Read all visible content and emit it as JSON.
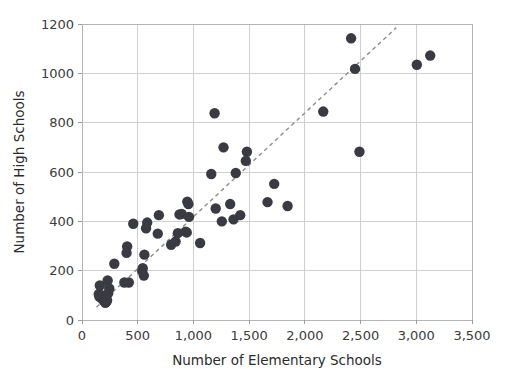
{
  "chart_data": {
    "type": "scatter",
    "title": "",
    "xlabel": "Number of Elementary Schools",
    "ylabel": "Number of High Schools",
    "xlim": [
      0,
      3500
    ],
    "ylim": [
      0,
      1200
    ],
    "grid": true,
    "legend": null,
    "xticks": [
      0,
      500,
      1000,
      1500,
      2000,
      2500,
      3000,
      3500
    ],
    "xticklabels": [
      "0",
      "500",
      "1,000",
      "1,500",
      "2,000",
      "2,500",
      "3,000",
      "3,500"
    ],
    "yticks": [
      0,
      200,
      400,
      600,
      800,
      1000,
      1200
    ],
    "yticklabels": [
      "0",
      "200",
      "400",
      "600",
      "800",
      "1000",
      "1200"
    ],
    "marker_color": "#3a3a42",
    "marker_size": 5.2,
    "grid_color": "#cfcfcf",
    "points": [
      {
        "x": 150,
        "y": 105
      },
      {
        "x": 155,
        "y": 95
      },
      {
        "x": 160,
        "y": 140
      },
      {
        "x": 175,
        "y": 88
      },
      {
        "x": 185,
        "y": 100
      },
      {
        "x": 195,
        "y": 78
      },
      {
        "x": 200,
        "y": 82
      },
      {
        "x": 205,
        "y": 90
      },
      {
        "x": 210,
        "y": 70
      },
      {
        "x": 215,
        "y": 85
      },
      {
        "x": 220,
        "y": 75
      },
      {
        "x": 225,
        "y": 80
      },
      {
        "x": 230,
        "y": 160
      },
      {
        "x": 235,
        "y": 108
      },
      {
        "x": 245,
        "y": 128
      },
      {
        "x": 290,
        "y": 228
      },
      {
        "x": 380,
        "y": 152
      },
      {
        "x": 400,
        "y": 272
      },
      {
        "x": 405,
        "y": 298
      },
      {
        "x": 420,
        "y": 152
      },
      {
        "x": 460,
        "y": 390
      },
      {
        "x": 540,
        "y": 198
      },
      {
        "x": 545,
        "y": 210
      },
      {
        "x": 555,
        "y": 180
      },
      {
        "x": 560,
        "y": 265
      },
      {
        "x": 575,
        "y": 372
      },
      {
        "x": 585,
        "y": 395
      },
      {
        "x": 680,
        "y": 350
      },
      {
        "x": 690,
        "y": 425
      },
      {
        "x": 800,
        "y": 305
      },
      {
        "x": 840,
        "y": 318
      },
      {
        "x": 860,
        "y": 352
      },
      {
        "x": 875,
        "y": 428
      },
      {
        "x": 895,
        "y": 430
      },
      {
        "x": 930,
        "y": 358
      },
      {
        "x": 940,
        "y": 355
      },
      {
        "x": 945,
        "y": 480
      },
      {
        "x": 955,
        "y": 470
      },
      {
        "x": 960,
        "y": 418
      },
      {
        "x": 1060,
        "y": 312
      },
      {
        "x": 1160,
        "y": 592
      },
      {
        "x": 1190,
        "y": 838
      },
      {
        "x": 1200,
        "y": 452
      },
      {
        "x": 1255,
        "y": 400
      },
      {
        "x": 1270,
        "y": 700
      },
      {
        "x": 1330,
        "y": 470
      },
      {
        "x": 1360,
        "y": 408
      },
      {
        "x": 1380,
        "y": 596
      },
      {
        "x": 1420,
        "y": 425
      },
      {
        "x": 1470,
        "y": 645
      },
      {
        "x": 1480,
        "y": 682
      },
      {
        "x": 1665,
        "y": 478
      },
      {
        "x": 1725,
        "y": 552
      },
      {
        "x": 1845,
        "y": 462
      },
      {
        "x": 2165,
        "y": 845
      },
      {
        "x": 2415,
        "y": 1142
      },
      {
        "x": 2450,
        "y": 1018
      },
      {
        "x": 2490,
        "y": 682
      },
      {
        "x": 3005,
        "y": 1035
      },
      {
        "x": 3125,
        "y": 1072
      }
    ],
    "trend_line": {
      "style": "dashed",
      "color": "#8d8d8d",
      "x_start": 130,
      "y_start": 52,
      "x_end": 2820,
      "y_end": 1185
    }
  }
}
